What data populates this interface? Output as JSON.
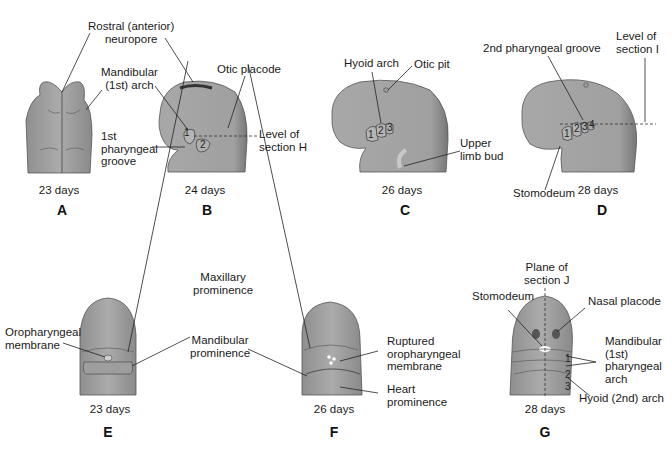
{
  "colors": {
    "tissue": "#a3a3a3",
    "tissue_dark": "#6e6e6e",
    "tissue_light": "#bdbdbd",
    "leader": "#222222",
    "background": "#ffffff"
  },
  "panels": {
    "A": {
      "letter": "A",
      "age": "23 days"
    },
    "B": {
      "letter": "B",
      "age": "24 days"
    },
    "C": {
      "letter": "C",
      "age": "26 days"
    },
    "D": {
      "letter": "D",
      "age": "28 days"
    },
    "E": {
      "letter": "E",
      "age": "23 days"
    },
    "F": {
      "letter": "F",
      "age": "26 days"
    },
    "G": {
      "letter": "G",
      "age": "28 days"
    }
  },
  "labels": {
    "rostral_neuropore": [
      "Rostral (anterior)",
      "neuropore"
    ],
    "mandibular_arch_ab": [
      "Mandibular",
      "(1st) arch"
    ],
    "otic_placode": "Otic placode",
    "first_pharyngeal_groove": [
      "1st",
      "pharyngeal",
      "groove"
    ],
    "level_section_h": [
      "Level of",
      "section H"
    ],
    "hyoid_arch": "Hyoid arch",
    "otic_pit": "Otic pit",
    "upper_limb_bud": [
      "Upper",
      "limb bud"
    ],
    "second_pharyngeal_groove": "2nd pharyngeal groove",
    "level_section_i": [
      "Level of",
      "section I"
    ],
    "stomodeum_d": "Stomodeum",
    "maxillary_prominence": [
      "Maxillary",
      "prominence"
    ],
    "oropharyngeal_membrane": [
      "Oropharyngeal",
      "membrane"
    ],
    "mandibular_prominence": [
      "Mandibular",
      "prominence"
    ],
    "ruptured_membrane": [
      "Ruptured",
      "oropharyngeal",
      "membrane"
    ],
    "heart_prominence": [
      "Heart",
      "prominence"
    ],
    "plane_section_j": [
      "Plane of",
      "section J"
    ],
    "stomodeum_g": "Stomodeum",
    "nasal_placode": "Nasal placode",
    "mandibular_pharyngeal_arch": [
      "Mandibular",
      "(1st)",
      "pharyngeal",
      "arch"
    ],
    "hyoid_2nd_arch": "Hyoid (2nd) arch"
  },
  "arch_numbers": {
    "B": [
      "1",
      "2"
    ],
    "C": [
      "1",
      "2",
      "3"
    ],
    "D": [
      "1",
      "2",
      "3",
      "4"
    ],
    "G": [
      "1",
      "2",
      "3"
    ]
  }
}
